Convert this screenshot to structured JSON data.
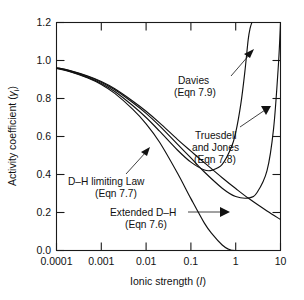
{
  "chart_data": {
    "type": "line",
    "title": "",
    "xlabel": "Ionic strength (I)",
    "xlabel_main": "Ionic strength (",
    "xlabel_italic": "I",
    "xlabel_close": ")",
    "ylabel": "Activity coefficient (γi)",
    "ylabel_main": "Activity coefficient (",
    "ylabel_symbol": "γ",
    "ylabel_sub": "i",
    "ylabel_close": ")",
    "xscale": "log",
    "xlim": [
      0.0001,
      10
    ],
    "ylim": [
      0.0,
      1.2
    ],
    "grid": false,
    "legend_position": "inline-annotations",
    "xticks": [
      0.0001,
      0.001,
      0.01,
      0.1,
      1,
      10
    ],
    "xticklabels": [
      "0.0001",
      "0.001",
      "0.01",
      "0.1",
      "1",
      "10"
    ],
    "yticks": [
      0.0,
      0.2,
      0.4,
      0.6,
      0.8,
      1.0,
      1.2
    ],
    "yticklabels": [
      "0.0",
      "0.2",
      "0.4",
      "0.6",
      "0.8",
      "1.0",
      "1.2"
    ],
    "series": [
      {
        "name": "D–H limiting Law",
        "equation": "Eqn 7.7",
        "x": [
          0.0001,
          0.0002,
          0.0005,
          0.001,
          0.002,
          0.005,
          0.01,
          0.02,
          0.05,
          0.1,
          0.2,
          0.3,
          0.5,
          0.7,
          0.85,
          1.0
        ],
        "y": [
          0.958,
          0.941,
          0.908,
          0.874,
          0.827,
          0.744,
          0.667,
          0.57,
          0.408,
          0.273,
          0.144,
          0.086,
          0.029,
          0.006,
          0.001,
          0.0
        ]
      },
      {
        "name": "Extended D–H",
        "equation": "Eqn 7.6",
        "x": [
          0.0001,
          0.0002,
          0.0005,
          0.001,
          0.002,
          0.005,
          0.01,
          0.02,
          0.05,
          0.1,
          0.2,
          0.5,
          1.0,
          2.0,
          5.0,
          10.0
        ],
        "y": [
          0.962,
          0.947,
          0.918,
          0.889,
          0.851,
          0.787,
          0.733,
          0.672,
          0.585,
          0.523,
          0.462,
          0.383,
          0.326,
          0.272,
          0.208,
          0.163
        ]
      },
      {
        "name": "Truesdell and Jones",
        "equation": "Eqn 7.8",
        "x": [
          0.0001,
          0.0002,
          0.0005,
          0.001,
          0.002,
          0.005,
          0.01,
          0.02,
          0.05,
          0.1,
          0.2,
          0.5,
          1.0,
          2.0,
          3.0,
          5.0,
          7.0,
          9.0,
          10.0
        ],
        "y": [
          0.961,
          0.946,
          0.916,
          0.886,
          0.846,
          0.779,
          0.722,
          0.656,
          0.56,
          0.487,
          0.413,
          0.328,
          0.284,
          0.277,
          0.305,
          0.42,
          0.64,
          0.98,
          1.2
        ]
      },
      {
        "name": "Davies",
        "equation": "Eqn 7.9",
        "x": [
          0.0001,
          0.0002,
          0.0005,
          0.001,
          0.002,
          0.005,
          0.01,
          0.02,
          0.05,
          0.1,
          0.2,
          0.3,
          0.5,
          0.8,
          1.0,
          1.3,
          1.6,
          1.9,
          2.1,
          2.3
        ],
        "y": [
          0.959,
          0.943,
          0.911,
          0.879,
          0.837,
          0.763,
          0.7,
          0.628,
          0.529,
          0.465,
          0.424,
          0.423,
          0.453,
          0.543,
          0.62,
          0.77,
          0.94,
          1.11,
          1.17,
          1.2
        ]
      }
    ],
    "annotations": [
      {
        "id": "davies",
        "line1": "Davies",
        "line2": "(Eqn 7.9)"
      },
      {
        "id": "truesdell-jones",
        "line1": "Truesdell",
        "line2": "and Jones",
        "line3": "(Eqn 7.8)"
      },
      {
        "id": "dh-limiting-law",
        "line1": "D–H limiting Law",
        "line2": "(Eqn 7.7)"
      },
      {
        "id": "extended-dh",
        "line1": "Extended D–H",
        "line2": "(Eqn 7.6)"
      }
    ],
    "colors": {
      "curve": "#111111",
      "axis": "#1a1a1a",
      "background": "#ffffff"
    }
  }
}
